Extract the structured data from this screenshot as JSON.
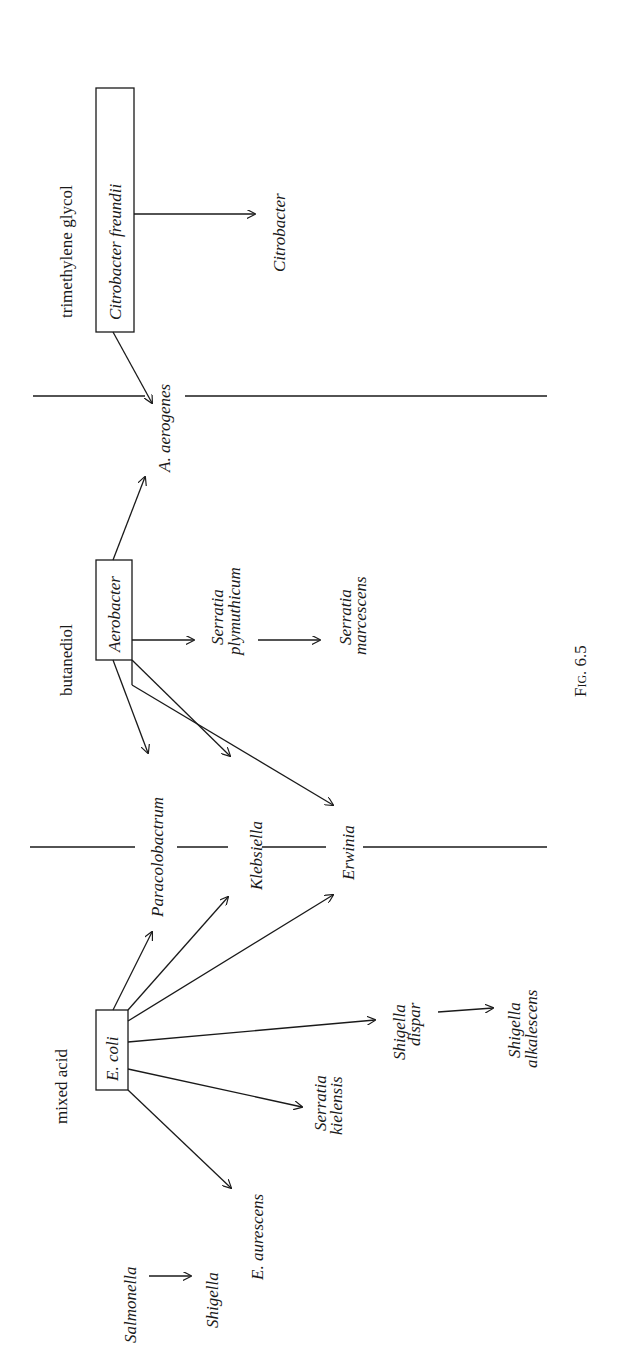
{
  "figure": {
    "caption": "Fig. 6.5",
    "orientation": "rotated 90° counter-clockwise",
    "groups": [
      {
        "fermentation_type": "mixed acid",
        "parent": "E. coli",
        "derived": [
          "E. aurescens",
          "Serratia kielensis",
          "Shigella dispar",
          "Paracolobactrum",
          "Klebsiella",
          "Erwinia"
        ]
      },
      {
        "fermentation_type": "butanediol",
        "parent": "Aerobacter",
        "derived": [
          "Paracolobactrum",
          "Klebsiella",
          "Erwinia",
          "Serratia plymuthicum",
          "A. aerogenes"
        ]
      },
      {
        "fermentation_type": "trimethylene glycol",
        "parent": "Citrobacter freundii",
        "derived": [
          "A. aerogenes",
          "Citrobacter"
        ]
      }
    ],
    "chains": [
      {
        "from": "Salmonella",
        "to": "Shigella"
      },
      {
        "from": "Shigella dispar",
        "to": "Shigella alkalescens"
      },
      {
        "from": "Serratia plymuthicum",
        "to": "Serratia marcescens"
      }
    ]
  },
  "labels": {
    "trimethylene_glycol": "trimethylene glycol",
    "butanediol": "butanediol",
    "mixed_acid": "mixed acid",
    "citrobacter_freundii": "Citrobacter freundii",
    "aerobacter": "Aerobacter",
    "e_coli": "E. coli",
    "citrobacter": "Citrobacter",
    "a_aerogenes": "A. aerogenes",
    "serratia_1": "Serratia",
    "plymuthicum": "plymuthicum",
    "serratia_2": "Serratia",
    "marcescens": "marcescens",
    "paracolobactrum": "Paracolobactrum",
    "klebsiella": "Klebsiella",
    "erwinia": "Erwinia",
    "shigella_1": "Shigella",
    "dispar": "dispar",
    "shigella_2": "Shigella",
    "alkalescens": "alkalescens",
    "serratia_3": "Serratia",
    "kielensis": "kielensis",
    "e_aurescens": "E. aurescens",
    "salmonella": "Salmonella",
    "shigella_3": "Shigella",
    "caption": "Fig. 6.5"
  }
}
